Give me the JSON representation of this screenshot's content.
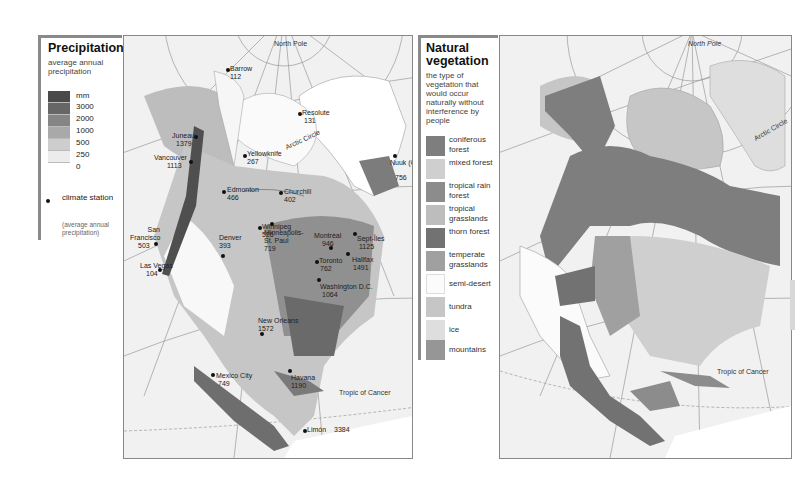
{
  "precipitation_legend": {
    "title": "Precipitation",
    "subtitle": "average annual precipitation",
    "unit": "mm",
    "classes": [
      {
        "label": "3000",
        "color": "#4a4a4a"
      },
      {
        "label": "2000",
        "color": "#666666"
      },
      {
        "label": "1000",
        "color": "#858585"
      },
      {
        "label": "500",
        "color": "#a9a9a9"
      },
      {
        "label": "250",
        "color": "#cdcdcd"
      },
      {
        "label": "0",
        "color": "#ececec"
      }
    ],
    "station_label": "climate station",
    "station_note": "(average annual precipitation)"
  },
  "vegetation_legend": {
    "title": "Natural vegetation",
    "subtitle": "the type of vegetation that would occur naturally without interference by people",
    "items": [
      {
        "label": "coniferous forest",
        "color": "#7e7e7e"
      },
      {
        "label": "mixed forest",
        "color": "#cfcfcf"
      },
      {
        "label": "tropical rain forest",
        "color": "#8c8c8c"
      },
      {
        "label": "tropical grasslands",
        "color": "#bdbdbd"
      },
      {
        "label": "thorn forest",
        "color": "#727272"
      },
      {
        "label": "temperate grasslands",
        "color": "#a0a0a0"
      },
      {
        "label": "semi-desert",
        "color": "#fbfbfb"
      },
      {
        "label": "tundra",
        "color": "#c6c6c6"
      },
      {
        "label": "ice",
        "color": "#dedede"
      },
      {
        "label": "mountains",
        "color": "#969696"
      }
    ]
  },
  "precipitation_map": {
    "geo_labels": {
      "north_pole": "North Pole",
      "arctic_circle": "Arctic Circle",
      "tropic_of_cancer": "Tropic of Cancer"
    },
    "stations": [
      {
        "name": "Barrow",
        "value": "112"
      },
      {
        "name": "Resolute",
        "value": "131"
      },
      {
        "name": "Juneau",
        "value": "1379"
      },
      {
        "name": "Yellowknife",
        "value": "267"
      },
      {
        "name": "Nuuk (Godthåb)",
        "value": "756"
      },
      {
        "name": "Vancouver",
        "value": "1113"
      },
      {
        "name": "Edmonton",
        "value": "466"
      },
      {
        "name": "Churchill",
        "value": "402"
      },
      {
        "name": "Winnipeg",
        "value": "526"
      },
      {
        "name": "San Francisco",
        "value": "503"
      },
      {
        "name": "Denver",
        "value": "393"
      },
      {
        "name": "Minneapolis-St. Paul",
        "value": "719"
      },
      {
        "name": "Montréal",
        "value": "946"
      },
      {
        "name": "Sept-Îles",
        "value": "1125"
      },
      {
        "name": "Halifax",
        "value": "1491"
      },
      {
        "name": "Toronto",
        "value": "762"
      },
      {
        "name": "Las Vegas",
        "value": "104"
      },
      {
        "name": "Washington D.C.",
        "value": "1064"
      },
      {
        "name": "New Orleans",
        "value": "1572"
      },
      {
        "name": "Mexico City",
        "value": "749"
      },
      {
        "name": "Havana",
        "value": "1190"
      },
      {
        "name": "Limón",
        "value": "3384"
      }
    ]
  },
  "vegetation_map": {
    "geo_labels": {
      "north_pole": "North Pole",
      "arctic_circle": "Arctic Circle",
      "tropic_of_cancer": "Tropic of Cancer"
    }
  }
}
